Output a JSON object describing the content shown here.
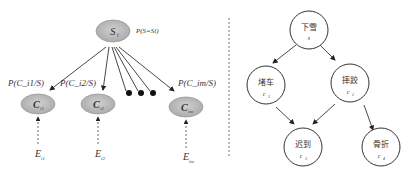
{
  "left_diagram": {
    "root": {
      "label": "S",
      "sub": "i",
      "prob_label": "P(S=Si)"
    },
    "edge_labels": [
      "P(C_i1/S)",
      "P(C_i2/S)",
      "P(C_im/S)"
    ],
    "nodes": [
      {
        "label": "C",
        "sub": "i1",
        "evidence": "E",
        "evidence_sub": "i1"
      },
      {
        "label": "C",
        "sub": "i2",
        "evidence": "E",
        "evidence_sub": "i2"
      },
      {
        "label": "C",
        "sub": "im",
        "evidence": "E",
        "evidence_sub": "im"
      }
    ],
    "ellipsis_dots": 3
  },
  "right_diagram": {
    "nodes": [
      {
        "id": "s",
        "label": "下雪",
        "var": "s"
      },
      {
        "id": "c1",
        "label": "堵车",
        "var": "c",
        "sub": "1"
      },
      {
        "id": "c2",
        "label": "摔跤",
        "var": "c",
        "sub": "2"
      },
      {
        "id": "c3",
        "label": "迟到",
        "var": "c",
        "sub": "3"
      },
      {
        "id": "c4",
        "label": "骨折",
        "var": "c",
        "sub": "4"
      }
    ],
    "edges": [
      [
        "s",
        "c1"
      ],
      [
        "s",
        "c2"
      ],
      [
        "c1",
        "c3"
      ],
      [
        "c2",
        "c3"
      ],
      [
        "c2",
        "c4"
      ]
    ]
  }
}
